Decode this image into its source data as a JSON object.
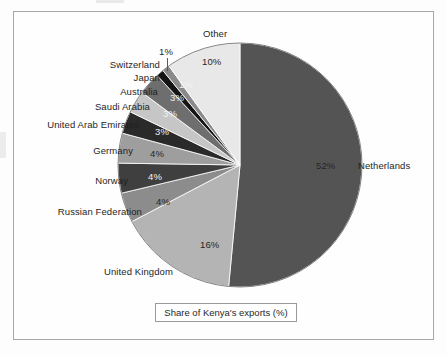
{
  "caption": {
    "text": "Share of Kenya's exports (%)"
  },
  "chart_data": {
    "type": "pie",
    "title": "Share of Kenya's exports (%)",
    "xlabel": "",
    "ylabel": "",
    "unit": "%",
    "legend_position": "outside-labels",
    "grid": false,
    "start_angle_deg": 0,
    "direction": "clockwise",
    "categories": [
      "Netherlands",
      "United Kingdom",
      "Russian Federation",
      "Norway",
      "Germany",
      "United Arab Emirates",
      "Saudi Arabia",
      "Australia",
      "Japan",
      "Switzerland",
      "Other"
    ],
    "values": [
      52,
      16,
      4,
      4,
      4,
      3,
      3,
      3,
      1,
      1,
      10
    ],
    "value_labels": [
      "52%",
      "16%",
      "4%",
      "4%",
      "4%",
      "3%",
      "3%",
      "3%",
      "1%",
      "1%",
      "10%"
    ],
    "colors": [
      "#545454",
      "#b4b4b4",
      "#8c8c8c",
      "#3f3f3f",
      "#9e9e9e",
      "#2a2a2a",
      "#c6c6c6",
      "#6e6e6e",
      "#141414",
      "#8a8a8a",
      "#e8e8e8"
    ],
    "slices": [
      {
        "label": "Netherlands",
        "value": 52,
        "display": "52%",
        "color": "#545454",
        "label_color": "dark"
      },
      {
        "label": "United Kingdom",
        "value": 16,
        "display": "16%",
        "color": "#b4b4b4",
        "label_color": "dark"
      },
      {
        "label": "Russian Federation",
        "value": 4,
        "display": "4%",
        "color": "#8c8c8c",
        "label_color": "dark"
      },
      {
        "label": "Norway",
        "value": 4,
        "display": "4%",
        "color": "#3f3f3f",
        "label_color": "light"
      },
      {
        "label": "Germany",
        "value": 4,
        "display": "4%",
        "color": "#9e9e9e",
        "label_color": "dark"
      },
      {
        "label": "United Arab Emirates",
        "value": 3,
        "display": "3%",
        "color": "#2a2a2a",
        "label_color": "light"
      },
      {
        "label": "Saudi Arabia",
        "value": 3,
        "display": "3%",
        "color": "#c6c6c6",
        "label_color": "light"
      },
      {
        "label": "Australia",
        "value": 3,
        "display": "3%",
        "color": "#6e6e6e",
        "label_color": "light"
      },
      {
        "label": "Japan",
        "value": 1,
        "display": "1%",
        "color": "#141414",
        "label_color": "light"
      },
      {
        "label": "Switzerland",
        "value": 1,
        "display": "1%",
        "color": "#8a8a8a",
        "label_color": "dark"
      },
      {
        "label": "Other",
        "value": 10,
        "display": "10%",
        "color": "#e8e8e8",
        "label_color": "dark"
      }
    ]
  },
  "labels": {
    "netherlands": "Netherlands",
    "united_kingdom": "United Kingdom",
    "russian_federation": "Russian Federation",
    "norway": "Norway",
    "germany": "Germany",
    "united_arab_emirates": "United Arab Emirates",
    "saudi_arabia": "Saudi Arabia",
    "australia": "Australia",
    "japan": "Japan",
    "switzerland": "Switzerland",
    "other": "Other"
  },
  "percent_labels": {
    "netherlands": "52%",
    "united_kingdom": "16%",
    "russian_federation": "4%",
    "norway": "4%",
    "germany": "4%",
    "united_arab_emirates": "3%",
    "saudi_arabia": "3%",
    "australia": "3%",
    "japan": "1%",
    "switzerland": "1%",
    "other": "10%"
  }
}
